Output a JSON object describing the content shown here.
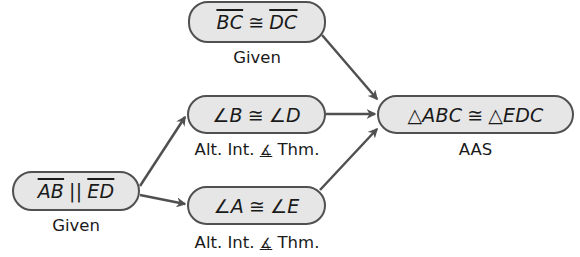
{
  "diagram": {
    "type": "flow-proof",
    "colors": {
      "node_fill": "#e6e6e6",
      "node_border": "#505050",
      "arrow": "#505050",
      "text": "#1a1a1a"
    },
    "nodes": [
      {
        "id": "bc_dc",
        "left": "BC",
        "sym": "≅",
        "right": "DC",
        "left_overline": true,
        "right_overline": true,
        "reason": "Given"
      },
      {
        "id": "ab_ed",
        "left": "AB",
        "sym": "||",
        "right": "ED",
        "left_overline": true,
        "right_overline": true,
        "reason": "Given"
      },
      {
        "id": "angB_angD",
        "left": "∠B",
        "sym": "≅",
        "right": "∠D",
        "reason_prefix": "Alt. Int. ",
        "reason_icon": "∡",
        "reason_suffix": " Thm."
      },
      {
        "id": "angA_angE",
        "left": "∠A",
        "sym": "≅",
        "right": "∠E",
        "reason_prefix": "Alt. Int. ",
        "reason_icon": "∡",
        "reason_suffix": " Thm."
      },
      {
        "id": "tri",
        "left": "△ABC",
        "sym": "≅",
        "right": "△EDC",
        "reason": "AAS"
      }
    ],
    "edges": [
      {
        "from": "ab_ed",
        "to": "angB_angD"
      },
      {
        "from": "ab_ed",
        "to": "angA_angE"
      },
      {
        "from": "bc_dc",
        "to": "tri"
      },
      {
        "from": "angB_angD",
        "to": "tri"
      },
      {
        "from": "angA_angE",
        "to": "tri"
      }
    ]
  }
}
